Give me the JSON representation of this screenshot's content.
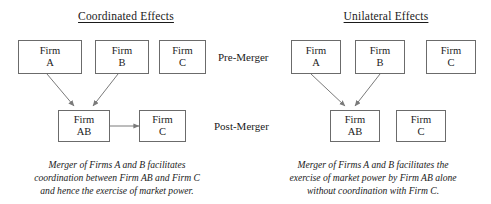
{
  "panels": {
    "left": {
      "title": "Coordinated Effects",
      "pre_merger": [
        {
          "word": "Firm",
          "id": "A"
        },
        {
          "word": "Firm",
          "id": "B"
        },
        {
          "word": "Firm",
          "id": "C"
        }
      ],
      "post_merger": [
        {
          "word": "Firm",
          "id": "AB"
        },
        {
          "word": "Firm",
          "id": "C"
        }
      ],
      "caption": [
        "Merger of Firms A and B facilitates",
        "coordination between Firm AB and Firm C",
        "and hence the exercise  of market power."
      ]
    },
    "right": {
      "title": "Unilateral Effects",
      "pre_merger": [
        {
          "word": "Firm",
          "id": "A"
        },
        {
          "word": "Firm",
          "id": "B"
        },
        {
          "word": "Firm",
          "id": "C"
        }
      ],
      "post_merger": [
        {
          "word": "Firm",
          "id": "AB"
        },
        {
          "word": "Firm",
          "id": "C"
        }
      ],
      "caption": [
        "Merger of Firms A and B facilitates the",
        "exercise  of market power by Firm AB alone",
        "without coordination with Firm C."
      ]
    }
  },
  "stage_labels": {
    "pre": "Pre-Merger",
    "post": "Post-Merger"
  },
  "colors": {
    "background": "#ffffff",
    "box_border": "#6b6b6b",
    "text": "#1a1a1a",
    "arrow": "#7a7a7a"
  },
  "connectors": {
    "left": [
      {
        "name": "firm-a-to-firm-ab",
        "kind": "arrow-single"
      },
      {
        "name": "firm-b-to-firm-ab",
        "kind": "arrow-single"
      },
      {
        "name": "firm-ab-to-firm-c-coordination",
        "kind": "arrow-double"
      }
    ],
    "right": [
      {
        "name": "firm-a-to-firm-ab",
        "kind": "arrow-single"
      },
      {
        "name": "firm-b-to-firm-ab",
        "kind": "arrow-single"
      }
    ]
  }
}
